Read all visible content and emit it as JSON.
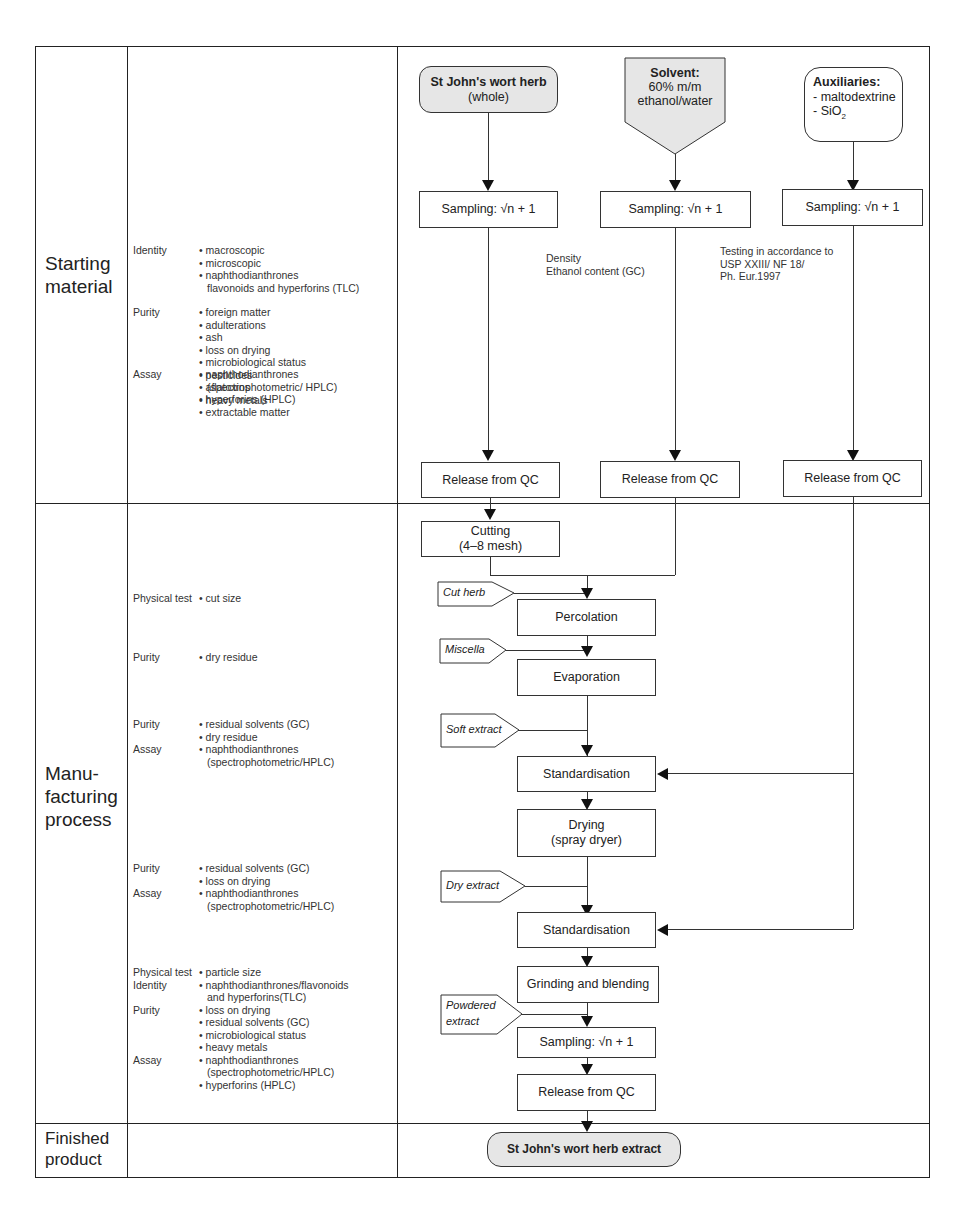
{
  "sections": {
    "starting_material": "Starting material",
    "manufacturing_process": "Manu-facturing process",
    "finished_product": "Finished product"
  },
  "section_labels": {
    "starting_line1": "Starting",
    "starting_line2": "material",
    "manu_line1": "Manu-",
    "manu_line2": "facturing",
    "manu_line3": "process",
    "finished_line1": "Finished",
    "finished_line2": "product"
  },
  "starting_tests": {
    "identity_label": "Identity",
    "identity_items": [
      "• macroscopic",
      "• microscopic",
      "• naphthodianthrones",
      "flavonoids and hyperforins (TLC)"
    ],
    "purity_label": "Purity",
    "purity_items": [
      "• foreign matter",
      "• adulterations",
      "• ash",
      "• loss on drying",
      "• microbiological status",
      "• pesticides",
      "• aflatoxins",
      "• heavy metals"
    ],
    "assay_label": "Assay",
    "assay_items": [
      "• naphthodianthrones",
      "(spectrophotometric/ HPLC)",
      "• hyperforins (HPLC)",
      "• extractable matter"
    ]
  },
  "manufacturing_tests": {
    "group1": {
      "label": "Physical test",
      "items": [
        "• cut size"
      ]
    },
    "group2": {
      "label": "Purity",
      "items": [
        "• dry residue"
      ]
    },
    "group3": {
      "purity_label": "Purity",
      "purity_items": [
        "• residual solvents (GC)",
        "• dry residue"
      ],
      "assay_label": "Assay",
      "assay_items": [
        "• naphthodianthrones",
        "(spectrophotometric/HPLC)"
      ]
    },
    "group4": {
      "purity_label": "Purity",
      "purity_items": [
        "• residual solvents (GC)",
        "• loss on drying"
      ],
      "assay_label": "Assay",
      "assay_items": [
        "• naphthodianthrones",
        "(spectrophotometric/HPLC)"
      ]
    },
    "group5": {
      "physical_label": "Physical test",
      "physical_items": [
        "• particle size"
      ],
      "identity_label": "Identity",
      "identity_items": [
        "• naphthodianthrones/flavonoids",
        "and hyperforins(TLC)"
      ],
      "purity_label": "Purity",
      "purity_items": [
        "• loss on drying",
        "• residual solvents (GC)",
        "• microbiological status",
        "• heavy metals"
      ],
      "assay_label": "Assay",
      "assay_items": [
        "• naphthodianthrones",
        "(spectrophotometric/HPLC)",
        "• hyperforins (HPLC)"
      ]
    }
  },
  "flow": {
    "herb_title": "St John's wort herb",
    "herb_sub": "(whole)",
    "solvent_title": "Solvent:",
    "solvent_line2": "60% m/m",
    "solvent_line3": "ethanol/water",
    "aux_title": "Auxiliaries:",
    "aux_line2": "- maltodextrine",
    "aux_line3_prefix": "- SiO",
    "aux_line3_sub": "2",
    "sampling": "Sampling: √n + 1",
    "solvent_note_1": "Density",
    "solvent_note_2": "Ethanol content (GC)",
    "aux_note_1": "Testing in accordance to",
    "aux_note_2": "USP XXIII/ NF 18/",
    "aux_note_3": "Ph. Eur.1997",
    "release": "Release from QC",
    "cutting_1": "Cutting",
    "cutting_2": "(4–8 mesh)",
    "percolation": "Percolation",
    "evaporation": "Evaporation",
    "standardisation": "Standardisation",
    "drying_1": "Drying",
    "drying_2": "(spray dryer)",
    "grinding": "Grinding and blending",
    "final_product": "St John's wort herb extract",
    "tags": {
      "cut_herb": "Cut herb",
      "miscella": "Miscella",
      "soft_extract": "Soft extract",
      "dry_extract": "Dry extract",
      "powdered_1": "Powdered",
      "powdered_2": "extract"
    }
  },
  "colors": {
    "line": "#222222",
    "rounded_fill": "#e6e6e6",
    "background": "#ffffff"
  }
}
